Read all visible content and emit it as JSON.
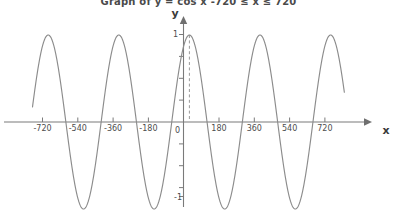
{
  "title": "Graph of y = cos x     -720 ≤ x ≤ 720",
  "axis_labels": {
    "x": "x",
    "y": "y"
  },
  "colors": {
    "curve": "#8c8c8c",
    "axis": "#7a7a7a",
    "text": "#4d4d4d",
    "background": "#ffffff",
    "dashed_guide": "#9a9a9a"
  },
  "chart_data": {
    "type": "line",
    "title": "Graph of y = cos x     -720 ≤ x ≤ 720",
    "xlabel": "x",
    "ylabel": "y",
    "function": "y = cos(x)",
    "angle_unit": "degrees",
    "xlim": [
      -800,
      790
    ],
    "ylim": [
      -1.35,
      1.3
    ],
    "grid": false,
    "legend": null,
    "x_ticks": [
      -720,
      -540,
      -360,
      -180,
      0,
      180,
      360,
      540,
      720
    ],
    "x_tick_labels": [
      "-720",
      "-540",
      "-360",
      "-180",
      "0",
      "180",
      "360",
      "540",
      "720"
    ],
    "y_ticks": [
      -1,
      1
    ],
    "y_tick_labels": [
      "-1",
      "1"
    ],
    "y_minor_ticks": [
      -0.75,
      -0.5,
      -0.25,
      0.25,
      0.5,
      0.75
    ],
    "annotations": [
      {
        "type": "dashed-vertical-line",
        "x": 30,
        "from_y": 0,
        "to_y": 1,
        "note": "dashed guide from x-axis up to curve maximum near x = 0"
      }
    ],
    "x": [
      -800,
      -780,
      -760,
      -740,
      -720,
      -700,
      -680,
      -660,
      -640,
      -620,
      -600,
      -580,
      -560,
      -540,
      -520,
      -500,
      -480,
      -460,
      -440,
      -420,
      -400,
      -380,
      -360,
      -340,
      -320,
      -300,
      -280,
      -260,
      -240,
      -220,
      -200,
      -180,
      -160,
      -140,
      -120,
      -100,
      -80,
      -60,
      -40,
      -20,
      0,
      20,
      40,
      60,
      80,
      100,
      120,
      140,
      160,
      180,
      200,
      220,
      240,
      260,
      280,
      300,
      320,
      340,
      360,
      380,
      400,
      420,
      440,
      460,
      480,
      500,
      520,
      540,
      560,
      580,
      600,
      620,
      640,
      660,
      680,
      700,
      720,
      740,
      760,
      780
    ],
    "values": [
      0.985,
      0.866,
      0.643,
      0.342,
      1.0,
      0.94,
      0.766,
      0.5,
      0.174,
      -0.174,
      -0.5,
      -0.766,
      -0.94,
      -1.0,
      -0.94,
      -0.766,
      -0.5,
      -0.174,
      0.174,
      0.5,
      0.766,
      0.94,
      1.0,
      0.94,
      0.766,
      0.5,
      0.174,
      -0.174,
      -0.5,
      -0.766,
      -0.94,
      -1.0,
      -0.94,
      -0.766,
      -0.5,
      -0.174,
      0.174,
      0.5,
      0.766,
      0.94,
      1.0,
      0.94,
      0.766,
      0.5,
      0.174,
      -0.174,
      -0.5,
      -0.766,
      -0.94,
      -1.0,
      -0.94,
      -0.766,
      -0.5,
      -0.174,
      0.174,
      0.5,
      0.766,
      0.94,
      1.0,
      0.94,
      0.766,
      0.5,
      0.174,
      -0.174,
      -0.5,
      -0.766,
      -0.94,
      -1.0,
      -0.94,
      -0.766,
      -0.5,
      -0.174,
      0.174,
      0.5,
      0.766,
      0.94,
      1.0,
      0.94,
      0.766,
      0.5
    ],
    "key_points": {
      "maxima_x": [
        -720,
        -360,
        0,
        360,
        720
      ],
      "minima_x": [
        -540,
        -180,
        180,
        540
      ],
      "zeros_x": [
        -630,
        -450,
        -270,
        -90,
        90,
        270,
        450,
        630
      ],
      "amplitude": 1,
      "period": 360
    }
  }
}
